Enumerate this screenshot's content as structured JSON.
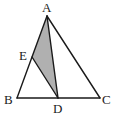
{
  "diagram": {
    "type": "triangle-geometry",
    "colors": {
      "stroke": "#1a1a1a",
      "shade": "#b0b0b0",
      "background": "#ffffff"
    },
    "points": {
      "A": {
        "label": "A",
        "x": 47,
        "y": 16
      },
      "B": {
        "label": "B",
        "x": 17,
        "y": 98
      },
      "C": {
        "label": "C",
        "x": 100,
        "y": 98
      },
      "D": {
        "label": "D",
        "x": 58,
        "y": 98
      },
      "E": {
        "label": "E",
        "x": 32,
        "y": 57
      }
    },
    "segments": [
      "AB",
      "BC",
      "CA",
      "AD",
      "ED"
    ],
    "shaded_region": "triangle AED"
  }
}
